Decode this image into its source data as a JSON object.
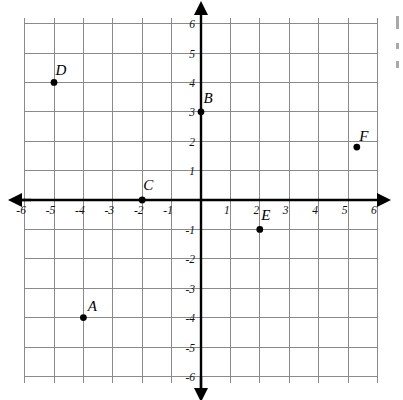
{
  "figure": {
    "kind": "cartesian-coordinate-plane",
    "background_color": "#ffffff",
    "grid_color": "#8a8a8a",
    "axis_color": "#000000",
    "point_color": "#000000"
  },
  "chart_data": {
    "type": "scatter",
    "title": "",
    "xlabel": "",
    "ylabel": "",
    "xlim": [
      -6,
      6
    ],
    "ylim": [
      -6,
      6
    ],
    "grid": true,
    "legend": "none",
    "x_ticks": [
      -6,
      -5,
      -4,
      -3,
      -2,
      -1,
      1,
      2,
      3,
      4,
      5,
      6
    ],
    "y_ticks": [
      6,
      5,
      4,
      3,
      2,
      1,
      -1,
      -2,
      -3,
      -4,
      -5,
      -6
    ],
    "x_tick_labels": [
      "-6",
      "-5",
      "-4",
      "-3",
      "-2",
      "-1",
      "1",
      "2",
      "3",
      "4",
      "5",
      "6"
    ],
    "y_tick_labels": [
      "6",
      "5",
      "4",
      "3",
      "2",
      "1",
      "-1",
      "-2",
      "-3",
      "-4",
      "-5",
      "-6"
    ],
    "points": [
      {
        "label": "A",
        "x": -4,
        "y": -4,
        "label_dx": 9,
        "label_dy": -7
      },
      {
        "label": "B",
        "x": 0,
        "y": 3,
        "label_dx": 7,
        "label_dy": -9
      },
      {
        "label": "C",
        "x": -2,
        "y": 0,
        "label_dx": 6,
        "label_dy": -10
      },
      {
        "label": "D",
        "x": -5,
        "y": 4,
        "label_dx": 7,
        "label_dy": -7
      },
      {
        "label": "E",
        "x": 2,
        "y": -1,
        "label_dx": 6,
        "label_dy": -9
      },
      {
        "label": "F",
        "x": 5.3,
        "y": 1.8,
        "label_dx": 7,
        "label_dy": -6
      }
    ]
  },
  "geometry": {
    "origin_x": 201,
    "origin_y": 200,
    "unit_px": 29.4,
    "grid_left": 25,
    "grid_top": 18,
    "grid_right": 378,
    "grid_bottom": 383,
    "axis_overshoot": 9,
    "point_radius": 3.4
  }
}
